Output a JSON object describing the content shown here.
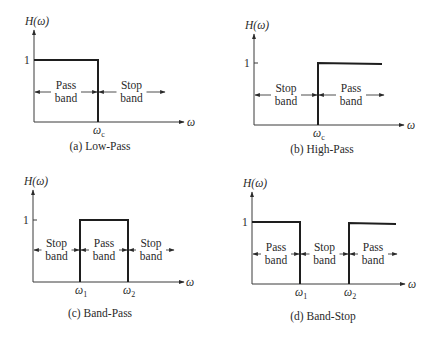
{
  "figure": {
    "colors": {
      "line": "#1e1e1e",
      "axis": "#3a3a3a",
      "text": "#2a2a2a",
      "background": "#ffffff"
    },
    "y_axis_label": "H(ω)",
    "x_axis_label": "ω",
    "unit_level_label": "1",
    "panels": [
      {
        "id": "low-pass",
        "caption": "(a) Low-Pass",
        "origin": [
          34,
          122
        ],
        "y_top": 30,
        "x_end": 184,
        "level_y": 60,
        "response": [
          [
            34,
            60
          ],
          [
            98,
            60
          ],
          [
            98,
            122
          ]
        ],
        "edges": [
          {
            "x": 98,
            "label": "ω",
            "sub": "c"
          }
        ],
        "arrow_y": 92,
        "bands": [
          {
            "line1": "Pass",
            "line2": "band",
            "x_start": 34,
            "x_end": 98
          },
          {
            "line1": "Stop",
            "line2": "band",
            "x_start": 98,
            "x_end": 165,
            "open": true
          }
        ],
        "caption_pos": [
          100,
          150
        ]
      },
      {
        "id": "high-pass",
        "caption": "(b) High-Pass",
        "origin": [
          254,
          125
        ],
        "y_top": 34,
        "x_end": 404,
        "level_y": 63,
        "response": [
          [
            318,
            125
          ],
          [
            318,
            63
          ],
          [
            382,
            64
          ]
        ],
        "edges": [
          {
            "x": 318,
            "label": "ω",
            "sub": "c"
          }
        ],
        "arrow_y": 95,
        "bands": [
          {
            "line1": "Stop",
            "line2": "band",
            "x_start": 254,
            "x_end": 318
          },
          {
            "line1": "Pass",
            "line2": "band",
            "x_start": 318,
            "x_end": 384,
            "open": true
          }
        ],
        "caption_pos": [
          322,
          153
        ]
      },
      {
        "id": "band-pass",
        "caption": "(c) Band-Pass",
        "origin": [
          33,
          282
        ],
        "y_top": 190,
        "x_end": 184,
        "level_y": 220,
        "response": [
          [
            80,
            282
          ],
          [
            80,
            220
          ],
          [
            128,
            220
          ],
          [
            128,
            282
          ]
        ],
        "edges": [
          {
            "x": 80,
            "label": "ω",
            "sub": "1"
          },
          {
            "x": 128,
            "label": "ω",
            "sub": "2"
          }
        ],
        "arrow_y": 250,
        "bands": [
          {
            "line1": "Stop",
            "line2": "band",
            "x_start": 33,
            "x_end": 80
          },
          {
            "line1": "Pass",
            "line2": "band",
            "x_start": 80,
            "x_end": 128
          },
          {
            "line1": "Stop",
            "line2": "band",
            "x_start": 128,
            "x_end": 174,
            "open": true
          }
        ],
        "caption_pos": [
          100,
          317
        ]
      },
      {
        "id": "band-stop",
        "caption": "(d) Band-Stop",
        "origin": [
          252,
          284
        ],
        "y_top": 192,
        "x_end": 405,
        "level_y": 222,
        "response": [
          [
            252,
            222
          ],
          [
            300,
            222
          ],
          [
            300,
            284
          ]
        ],
        "response2": [
          [
            349,
            284
          ],
          [
            349,
            223
          ],
          [
            396,
            224
          ]
        ],
        "edges": [
          {
            "x": 300,
            "label": "ω",
            "sub": "1"
          },
          {
            "x": 349,
            "label": "ω",
            "sub": "2"
          }
        ],
        "arrow_y": 254,
        "bands": [
          {
            "line1": "Pass",
            "line2": "band",
            "x_start": 252,
            "x_end": 300
          },
          {
            "line1": "Stop",
            "line2": "band",
            "x_start": 300,
            "x_end": 349
          },
          {
            "line1": "Pass",
            "line2": "band",
            "x_start": 349,
            "x_end": 397,
            "open": true
          }
        ],
        "caption_pos": [
          323,
          320
        ]
      }
    ]
  }
}
